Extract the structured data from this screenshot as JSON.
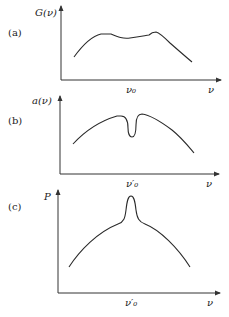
{
  "panels": [
    {
      "id": "a",
      "panel_label": "(a)",
      "ylabel": "G(ν)",
      "xlabel": "ν",
      "center_tick_label": "ν₀",
      "description": "Broad gain profile with a slight dip near centre and a small bump right of centre"
    },
    {
      "id": "b",
      "panel_label": "(b)",
      "ylabel": "a(ν)",
      "xlabel": "ν",
      "center_tick_label": "ν′₀",
      "description": "Broad profile with a narrow hole burned at ν′₀"
    },
    {
      "id": "c",
      "panel_label": "(c)",
      "ylabel": "P",
      "xlabel": "ν",
      "center_tick_label": "ν′₀",
      "description": "Broad profile with a narrow peak at ν′₀"
    }
  ],
  "colors": {
    "line": "#2a2a2a",
    "axis": "#333333",
    "background": "#ffffff"
  }
}
